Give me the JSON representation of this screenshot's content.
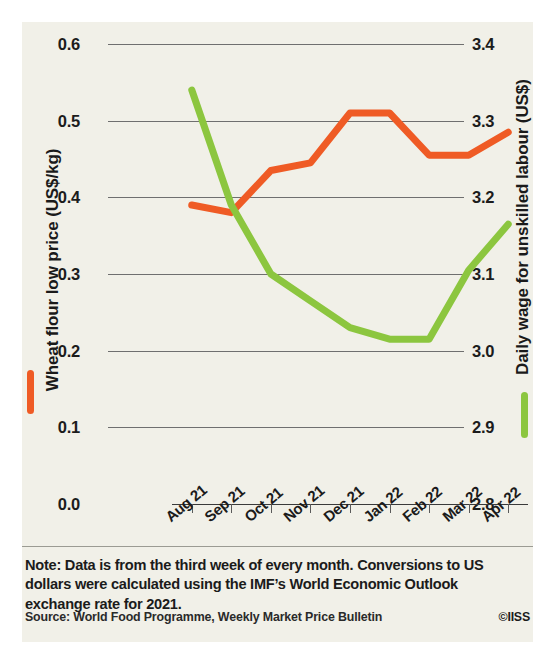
{
  "figure": {
    "background_color": "#f1f0e8",
    "note": "Note: Data is from the third week of every month. Conversions to US dollars were calculated using the IMF’s World Economic Outlook exchange rate for 2021.",
    "source": "Source: World Food Programme, Weekly Market Price Bulletin",
    "copyright": "©IISS"
  },
  "chart_data": {
    "type": "line",
    "title": "",
    "xlabel": "",
    "grid": true,
    "legend_position": "axis-titles",
    "categories": [
      "Aug 21",
      "Sep 21",
      "Oct 21",
      "Nov 21",
      "Dec 21",
      "Jan 22",
      "Feb 22",
      "Mar 22",
      "Apr 22"
    ],
    "axes": {
      "left": {
        "label": "Wheat flour low price (US$/kg)",
        "ticks": [
          "0.0",
          "0.1",
          "0.2",
          "0.3",
          "0.4",
          "0.5",
          "0.6"
        ],
        "ylim": [
          0.0,
          0.6
        ],
        "color": "#ef5b25"
      },
      "right": {
        "label": "Daily wage for unskilled labour (US$)",
        "ticks": [
          "2.8",
          "2.9",
          "3.0",
          "3.1",
          "3.2",
          "3.3",
          "3.4"
        ],
        "ylim": [
          2.8,
          3.4
        ],
        "color": "#8cc63f"
      }
    },
    "series": [
      {
        "name": "Wheat flour low price (US$/kg)",
        "axis": "left",
        "color": "#ef5b25",
        "values": [
          0.39,
          0.38,
          0.435,
          0.445,
          0.51,
          0.51,
          0.455,
          0.455,
          0.485
        ]
      },
      {
        "name": "Daily wage for unskilled labour (US$)",
        "axis": "right",
        "color": "#8cc63f",
        "values": [
          3.34,
          3.19,
          3.1,
          3.065,
          3.03,
          3.015,
          3.015,
          3.105,
          3.165
        ]
      }
    ]
  }
}
